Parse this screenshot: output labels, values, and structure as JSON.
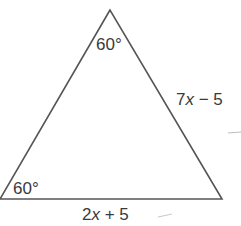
{
  "figure": {
    "type": "triangle",
    "stroke_color": "#555555",
    "text_color": "#3a3a3a",
    "vertices": {
      "apex": [
        110,
        10
      ],
      "bottom_left": [
        0,
        199
      ],
      "bottom_right": [
        222,
        199
      ]
    },
    "angle_labels": {
      "apex": "60°",
      "bottom_left": "60°"
    },
    "side_labels": {
      "right": {
        "coef": "7",
        "var": "x",
        "rest": " − 5"
      },
      "bottom": {
        "coef": "2",
        "var": "x",
        "rest": " + 5"
      }
    }
  }
}
